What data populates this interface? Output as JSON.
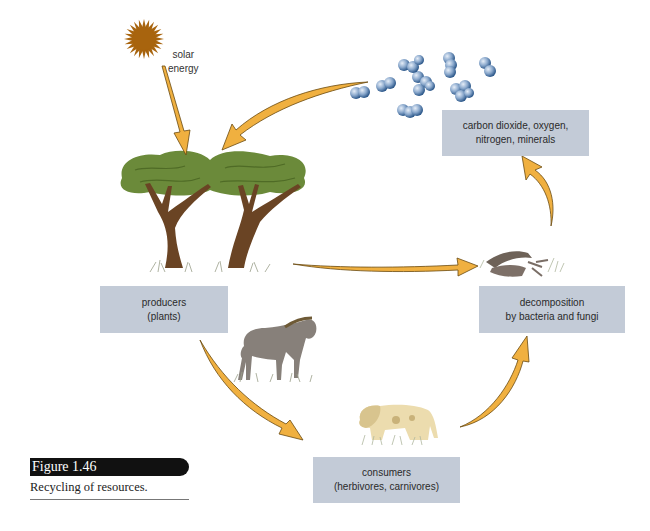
{
  "figure": {
    "number": "Figure 1.46",
    "caption": "Recycling of resources."
  },
  "labels": {
    "solar_energy_line1": "solar",
    "solar_energy_line2": "energy"
  },
  "boxes": {
    "atmosphere": {
      "line1": "carbon dioxide, oxygen,",
      "line2": "nitrogen, minerals"
    },
    "producers": {
      "line1": "producers",
      "line2": "(plants)"
    },
    "decomposition": {
      "line1": "decomposition",
      "line2": "by bacteria and fungi"
    },
    "consumers": {
      "line1": "consumers",
      "line2": "(herbivores, carnivores)"
    }
  },
  "colors": {
    "box_fill": "#c3cbd7",
    "arrow_fill": "#f0b040",
    "arrow_stroke": "#6a4a10",
    "sun": "#a8640e",
    "foliage": "#6b8a3a",
    "trunk": "#6a4424",
    "molecule": "#7f9fc4"
  },
  "flow": [
    "solar energy -> producers",
    "atmosphere -> producers",
    "producers -> decomposition",
    "producers -> consumers",
    "consumers -> decomposition",
    "decomposition -> atmosphere"
  ]
}
